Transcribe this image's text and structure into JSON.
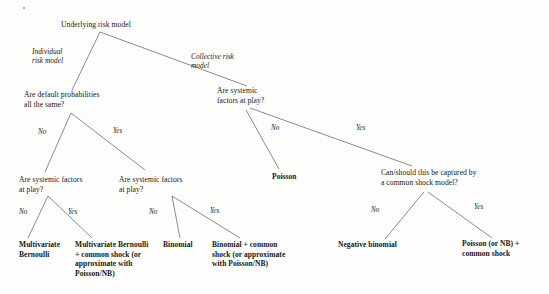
{
  "diagram": {
    "type": "decision-tree",
    "root": {
      "label": "Underlying risk model"
    },
    "branch_labels": {
      "individual": "Individual\nrisk model",
      "collective": "Collective risk\nmodel"
    },
    "questions": {
      "default_probabilities": "Are default probabilities\nall the same?",
      "systemic_left": "Are systemic factors\nat play?",
      "systemic_middle": "Are systemic factors\nat play?",
      "systemic_collective": "Are systemic\nfactors at play?",
      "common_shock": "Can/should this be captured by\na common shock model?"
    },
    "edge_labels": {
      "q1_no": "No",
      "q1_yes": "Yes",
      "q2_no": "No",
      "q2_yes": "Yes",
      "q3_no": "No",
      "q3_yes": "Yes",
      "q4_no": "No",
      "q4_yes": "Yes",
      "q5_no": "No",
      "q5_yes": "Yes"
    },
    "leaves": {
      "multivariate_bernoulli": "Multivariate\nBernoulli",
      "multivariate_bernoulli_shock": "Multivariate Bernoulli\n+ common shock (or\napproximate with\nPoisson/NB)",
      "binomial": "Binomial",
      "binomial_shock": "Binomial + common\nshock (or approximate\nwith  Poisson/NB)",
      "poisson": "Poisson",
      "negative_binomial": "Negative binomial",
      "poisson_shock": "Poisson (or NB) +\ncommon shock"
    },
    "colors": {
      "text": "#171717",
      "edge": "#5a5a5a",
      "background": "#fdfdfc"
    }
  }
}
